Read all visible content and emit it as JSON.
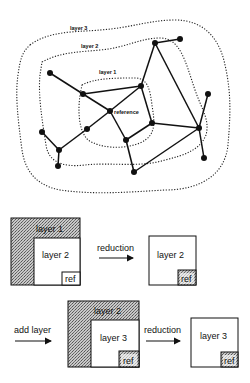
{
  "network": {
    "labels": {
      "layer3": "layer 3",
      "layer2": "layer 2",
      "layer1": "layer 1",
      "reference": "reference"
    },
    "nodes": [
      {
        "id": "A",
        "x": 50,
        "y": 73
      },
      {
        "id": "B",
        "x": 83,
        "y": 94
      },
      {
        "id": "ref",
        "x": 110,
        "y": 111
      },
      {
        "id": "C",
        "x": 87,
        "y": 129
      },
      {
        "id": "D",
        "x": 59,
        "y": 150
      },
      {
        "id": "E",
        "x": 42,
        "y": 132
      },
      {
        "id": "F",
        "x": 58,
        "y": 166
      },
      {
        "id": "G",
        "x": 141,
        "y": 86
      },
      {
        "id": "H",
        "x": 155,
        "y": 43
      },
      {
        "id": "I",
        "x": 180,
        "y": 39
      },
      {
        "id": "J",
        "x": 152,
        "y": 123
      },
      {
        "id": "K",
        "x": 126,
        "y": 140
      },
      {
        "id": "L",
        "x": 134,
        "y": 172
      },
      {
        "id": "M",
        "x": 199,
        "y": 128
      },
      {
        "id": "N",
        "x": 208,
        "y": 94
      },
      {
        "id": "O",
        "x": 204,
        "y": 158
      }
    ],
    "edges": [
      [
        "H",
        "I"
      ],
      [
        "H",
        "G"
      ],
      [
        "H",
        "M"
      ],
      [
        "G",
        "J"
      ],
      [
        "G",
        "B"
      ],
      [
        "G",
        "ref"
      ],
      [
        "J",
        "K"
      ],
      [
        "J",
        "M"
      ],
      [
        "M",
        "N"
      ],
      [
        "M",
        "O"
      ],
      [
        "M",
        "L"
      ],
      [
        "L",
        "K"
      ],
      [
        "K",
        "ref"
      ],
      [
        "ref",
        "B"
      ],
      [
        "B",
        "A"
      ],
      [
        "ref",
        "C"
      ],
      [
        "C",
        "D"
      ],
      [
        "D",
        "E"
      ],
      [
        "D",
        "F"
      ]
    ]
  },
  "step1": {
    "box_before": {
      "outer_label": "layer 1",
      "inner_label": "layer 2",
      "ref_label": "ref"
    },
    "arrow_label": "reduction",
    "box_after": {
      "inner_label": "layer 2",
      "ref_label": "ref"
    }
  },
  "step2": {
    "arrow_in_label": "add layer",
    "box_before": {
      "outer_label": "layer 2",
      "inner_label": "layer 3",
      "ref_label": "ref"
    },
    "arrow_label": "reduction",
    "box_after": {
      "inner_label": "layer 3",
      "ref_label": "ref"
    }
  },
  "colors": {
    "ink": "#111111",
    "hatch": "#9a9a9a",
    "background": "#ffffff"
  }
}
